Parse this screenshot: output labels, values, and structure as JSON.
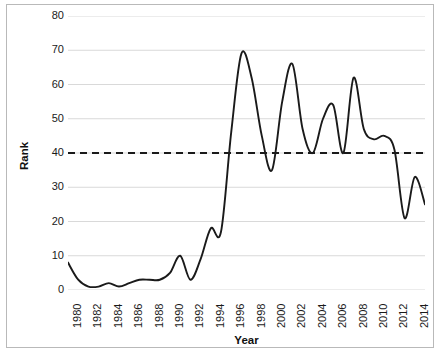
{
  "chart_data": {
    "type": "line",
    "title": "",
    "xlabel": "Year",
    "ylabel": "Rank",
    "xlim": [
      1980,
      2015
    ],
    "ylim": [
      0,
      80
    ],
    "grid": true,
    "legend": "none",
    "x_tick_labels": [
      "1980",
      "1982",
      "1984",
      "1986",
      "1988",
      "1990",
      "1992",
      "1994",
      "1996",
      "1998",
      "2000",
      "2002",
      "2004",
      "2006",
      "2008",
      "2010",
      "2012",
      "2014"
    ],
    "y_tick_labels": [
      "0",
      "10",
      "20",
      "30",
      "40",
      "50",
      "60",
      "70",
      "80"
    ],
    "x": [
      1980,
      1981,
      1982,
      1983,
      1984,
      1985,
      1986,
      1987,
      1988,
      1989,
      1990,
      1991,
      1992,
      1993,
      1994,
      1995,
      1996,
      1997,
      1998,
      1999,
      2000,
      2001,
      2002,
      2003,
      2004,
      2005,
      2006,
      2007,
      2008,
      2009,
      2010,
      2011,
      2012,
      2013,
      2014,
      2015
    ],
    "series": [
      {
        "name": "Rank",
        "color": "#1a1a1a",
        "values": [
          8,
          3,
          1,
          1,
          2,
          1,
          2,
          3,
          3,
          3,
          5,
          10,
          3,
          9,
          18,
          17,
          46,
          69,
          62,
          45,
          35,
          55,
          66,
          47,
          40,
          50,
          54,
          40,
          62,
          47,
          44,
          45,
          41,
          21,
          33,
          25
        ]
      }
    ],
    "reference_line": {
      "name": "threshold",
      "value": 40,
      "style": "dashed",
      "color": "#1a1a1a"
    }
  },
  "axis": {
    "y_title": "Rank",
    "x_title": "Year"
  }
}
